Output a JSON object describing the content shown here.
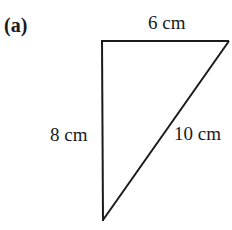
{
  "figure": {
    "part_label": "(a)",
    "shape": "right-triangle",
    "vertices": {
      "top_left": [
        102,
        41
      ],
      "top_right": [
        229,
        41
      ],
      "bottom": [
        103,
        220
      ]
    },
    "sides": [
      {
        "id": "top",
        "label": "6 cm",
        "length_cm": 6
      },
      {
        "id": "left",
        "label": "8 cm",
        "length_cm": 8
      },
      {
        "id": "hypotenuse",
        "label": "10 cm",
        "length_cm": 10
      }
    ],
    "stroke_color": "#1a1a1a",
    "background_color": "#ffffff"
  }
}
